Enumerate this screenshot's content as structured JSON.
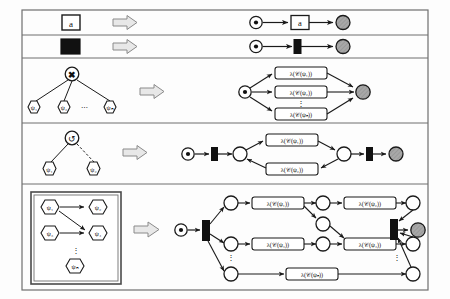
{
  "figure": {
    "type": "diagram",
    "frame": {
      "x": 22,
      "y": 10,
      "w": 406,
      "h": 280,
      "stroke": "#6f6f6f",
      "fill": "#fdfdfd"
    },
    "arrow_symbol": "double-arrow-right",
    "colors": {
      "line": "#1a1a1a",
      "frame": "#6f6f6f",
      "place_fill": "#ffffff",
      "final_place_fill": "#9c9c9c",
      "transition_fill": "#111111",
      "label_fill": "#ffffff",
      "arrow_fill": "#e8e8e8",
      "arrow_stroke": "#8a8a8a"
    },
    "rows": [
      {
        "id": "row-activity",
        "divider_y": 35,
        "left": {
          "kind": "leaf-activity",
          "node_label": "a",
          "shape": "square"
        },
        "right": {
          "kind": "petri-net",
          "places": [
            "source",
            "sink"
          ],
          "transitions": [
            {
              "label": "a",
              "style": "labelled-square"
            }
          ]
        }
      },
      {
        "id": "row-silent",
        "divider_y": 58,
        "left": {
          "kind": "leaf-silent",
          "node_label": "",
          "shape": "filled-square"
        },
        "right": {
          "kind": "petri-net",
          "places": [
            "source",
            "sink"
          ],
          "transitions": [
            {
              "label": "",
              "style": "black-bar"
            }
          ]
        }
      },
      {
        "id": "row-xor",
        "divider_y": 123,
        "left": {
          "kind": "tree",
          "root_operator": "✖",
          "root_operator_name": "xor",
          "children": [
            "ψ₁",
            "ψ₂",
            "ψₙ"
          ],
          "ellipsis": "⋯"
        },
        "right": {
          "kind": "petri-net",
          "branch_labels": [
            "λ(𝒞(ψ₁))",
            "λ(𝒞(ψ₂))",
            "λ(𝒞(ψₙ))"
          ],
          "vertical_ellipsis": "⋮"
        }
      },
      {
        "id": "row-loop",
        "divider_y": 184,
        "left": {
          "kind": "tree",
          "root_operator": "↺",
          "root_operator_name": "loop",
          "children": [
            "ψ₁",
            "ψ₂"
          ],
          "dashed_edge_to": "ψ₂"
        },
        "right": {
          "kind": "petri-net",
          "do_label": "λ(𝒞(ψ₁))",
          "redo_label": "λ(𝒞(ψ₂))"
        }
      },
      {
        "id": "row-parallel-partial-order",
        "left": {
          "kind": "partial-order-box",
          "nodes": [
            "ψ₁",
            "ψ₂",
            "ψ₃",
            "ψ₄",
            "ψₙ"
          ],
          "edges": [
            {
              "from": "ψ₁",
              "to": "ψ₂"
            },
            {
              "from": "ψ₁",
              "to": "ψ₄"
            },
            {
              "from": "ψ₃",
              "to": "ψ₄"
            }
          ],
          "ellipsis": "⋮"
        },
        "right": {
          "kind": "petri-net",
          "labels": [
            "λ(𝒞(ψ₁))",
            "λ(𝒞(ψ₂))",
            "λ(𝒞(ψ₃))",
            "λ(𝒞(ψ₄))",
            "λ(𝒞(ψₙ))"
          ],
          "vertical_ellipsis": "⋮"
        }
      }
    ]
  }
}
